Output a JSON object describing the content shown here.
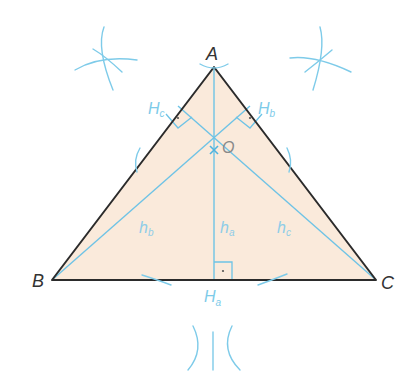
{
  "diagram": {
    "colors": {
      "triangle_fill": "#faeadb",
      "triangle_stroke": "#2b2b2b",
      "construction": "#6ec3e6",
      "label_dark": "#333333",
      "label_light": "#7ecbe9"
    },
    "vertices": {
      "A": {
        "label": "A",
        "x": 214,
        "y": 67
      },
      "B": {
        "label": "B",
        "x": 52,
        "y": 280
      },
      "C": {
        "label": "C",
        "x": 376,
        "y": 280
      }
    },
    "feet": {
      "Ha": {
        "label": "H",
        "sub": "a",
        "x": 214,
        "y": 280
      },
      "Hb": {
        "label": "H",
        "sub": "b",
        "x": 246,
        "y": 109
      },
      "Hc": {
        "label": "H",
        "sub": "c",
        "x": 182,
        "y": 109
      }
    },
    "orthocenter": {
      "label": "O",
      "x": 214,
      "y": 150
    },
    "altitudes": [
      {
        "label": "h",
        "sub": "a",
        "from": "A",
        "to": "Ha"
      },
      {
        "label": "h",
        "sub": "b",
        "from": "B",
        "to": "Hb"
      },
      {
        "label": "h",
        "sub": "c",
        "from": "C",
        "to": "Hc"
      }
    ]
  }
}
